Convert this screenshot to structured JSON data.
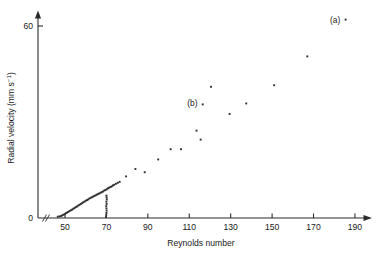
{
  "chart_data": {
    "type": "scatter",
    "title": "",
    "subtitle": "",
    "xlabel": "Reynolds number",
    "ylabel": "Radial velocity (mm s⁻¹)",
    "ylabel_main": "Radial velocity (mm s",
    "ylabel_sup": "−1",
    "ylabel_tail": ")",
    "xlim": [
      44,
      196
    ],
    "ylim": [
      0,
      66
    ],
    "xticks": [
      50,
      70,
      90,
      110,
      130,
      150,
      170,
      190
    ],
    "xtick_labels": [
      "50",
      "70",
      "90",
      "110",
      "130",
      "150",
      "170",
      "190"
    ],
    "yticks": [
      0,
      60
    ],
    "ytick_labels": [
      "0",
      "60"
    ],
    "grid": false,
    "legend": "none",
    "axis_style": "arrow-terminated open axes with x-axis break near origin",
    "axis_break_symbol": "//",
    "marker": "small filled square",
    "marker_color": "#2f2f2f",
    "annotations": [
      {
        "label": "(a)",
        "x": 178,
        "y": 62,
        "note": "labels top-right data point"
      },
      {
        "label": "(b)",
        "x": 109,
        "y": 36,
        "note": "labels data point near Re 115"
      }
    ],
    "series": [
      {
        "name": "upper branch (dense low-Re band)",
        "points": [
          [
            46.5,
            0.4
          ],
          [
            47.3,
            0.5
          ],
          [
            48.0,
            0.6
          ],
          [
            48.6,
            0.8
          ],
          [
            49.2,
            1.0
          ],
          [
            49.8,
            1.2
          ],
          [
            50.4,
            1.5
          ],
          [
            51.0,
            1.7
          ],
          [
            51.6,
            1.9
          ],
          [
            52.2,
            2.2
          ],
          [
            52.8,
            2.4
          ],
          [
            53.4,
            2.6
          ],
          [
            54.0,
            2.9
          ],
          [
            54.6,
            3.1
          ],
          [
            55.2,
            3.4
          ],
          [
            55.8,
            3.6
          ],
          [
            56.4,
            3.9
          ],
          [
            57.0,
            4.1
          ],
          [
            57.6,
            4.4
          ],
          [
            58.2,
            4.6
          ],
          [
            58.8,
            4.9
          ],
          [
            59.4,
            5.1
          ],
          [
            60.0,
            5.4
          ],
          [
            60.6,
            5.6
          ],
          [
            61.2,
            5.8
          ],
          [
            61.8,
            6.1
          ],
          [
            62.4,
            6.3
          ],
          [
            63.0,
            6.5
          ],
          [
            63.6,
            6.7
          ],
          [
            64.2,
            6.9
          ],
          [
            64.8,
            7.1
          ],
          [
            65.4,
            7.3
          ],
          [
            66.0,
            7.5
          ],
          [
            66.6,
            7.7
          ],
          [
            67.2,
            7.9
          ],
          [
            67.8,
            8.1
          ],
          [
            68.4,
            8.3
          ],
          [
            69.0,
            8.6
          ],
          [
            69.6,
            8.8
          ],
          [
            70.2,
            9.0
          ],
          [
            70.8,
            9.3
          ],
          [
            71.4,
            9.5
          ],
          [
            72.0,
            9.7
          ],
          [
            72.6,
            9.9
          ],
          [
            73.2,
            10.2
          ],
          [
            73.8,
            10.4
          ],
          [
            74.6,
            10.7
          ],
          [
            75.5,
            11.0
          ],
          [
            76.4,
            11.3
          ]
        ]
      },
      {
        "name": "vertical branch at critical Reynolds number",
        "points": [
          [
            69.8,
            0.3
          ],
          [
            69.9,
            0.9
          ],
          [
            70.0,
            1.6
          ],
          [
            70.1,
            2.3
          ],
          [
            70.0,
            3.0
          ],
          [
            69.9,
            3.7
          ],
          [
            70.1,
            4.4
          ],
          [
            70.0,
            5.1
          ],
          [
            70.2,
            5.8
          ],
          [
            70.1,
            6.4
          ],
          [
            70.0,
            7.0
          ]
        ]
      },
      {
        "name": "high-Re scatter",
        "points": [
          [
            79.5,
            13.0
          ],
          [
            84.0,
            15.3
          ],
          [
            88.5,
            14.3
          ],
          [
            95.0,
            18.3
          ],
          [
            101.0,
            21.5
          ],
          [
            106.0,
            21.5
          ],
          [
            113.5,
            27.3
          ],
          [
            115.5,
            24.5
          ],
          [
            116.5,
            35.5
          ],
          [
            120.5,
            41.0
          ],
          [
            129.5,
            32.5
          ],
          [
            137.5,
            35.8
          ],
          [
            151.0,
            41.5
          ],
          [
            167.0,
            50.5
          ],
          [
            185.5,
            62.0
          ]
        ]
      }
    ]
  },
  "axes_geometry": {
    "origin_x_px": 38,
    "origin_y_px": 218,
    "x_px_per_unit": 2.071,
    "x_ref_value": 50,
    "x_ref_px": 65,
    "y_px_per_unit": 3.2,
    "y_ref_value": 60,
    "y_ref_px": 26,
    "x_axis_end_px": 371,
    "y_axis_top_px": 12
  }
}
